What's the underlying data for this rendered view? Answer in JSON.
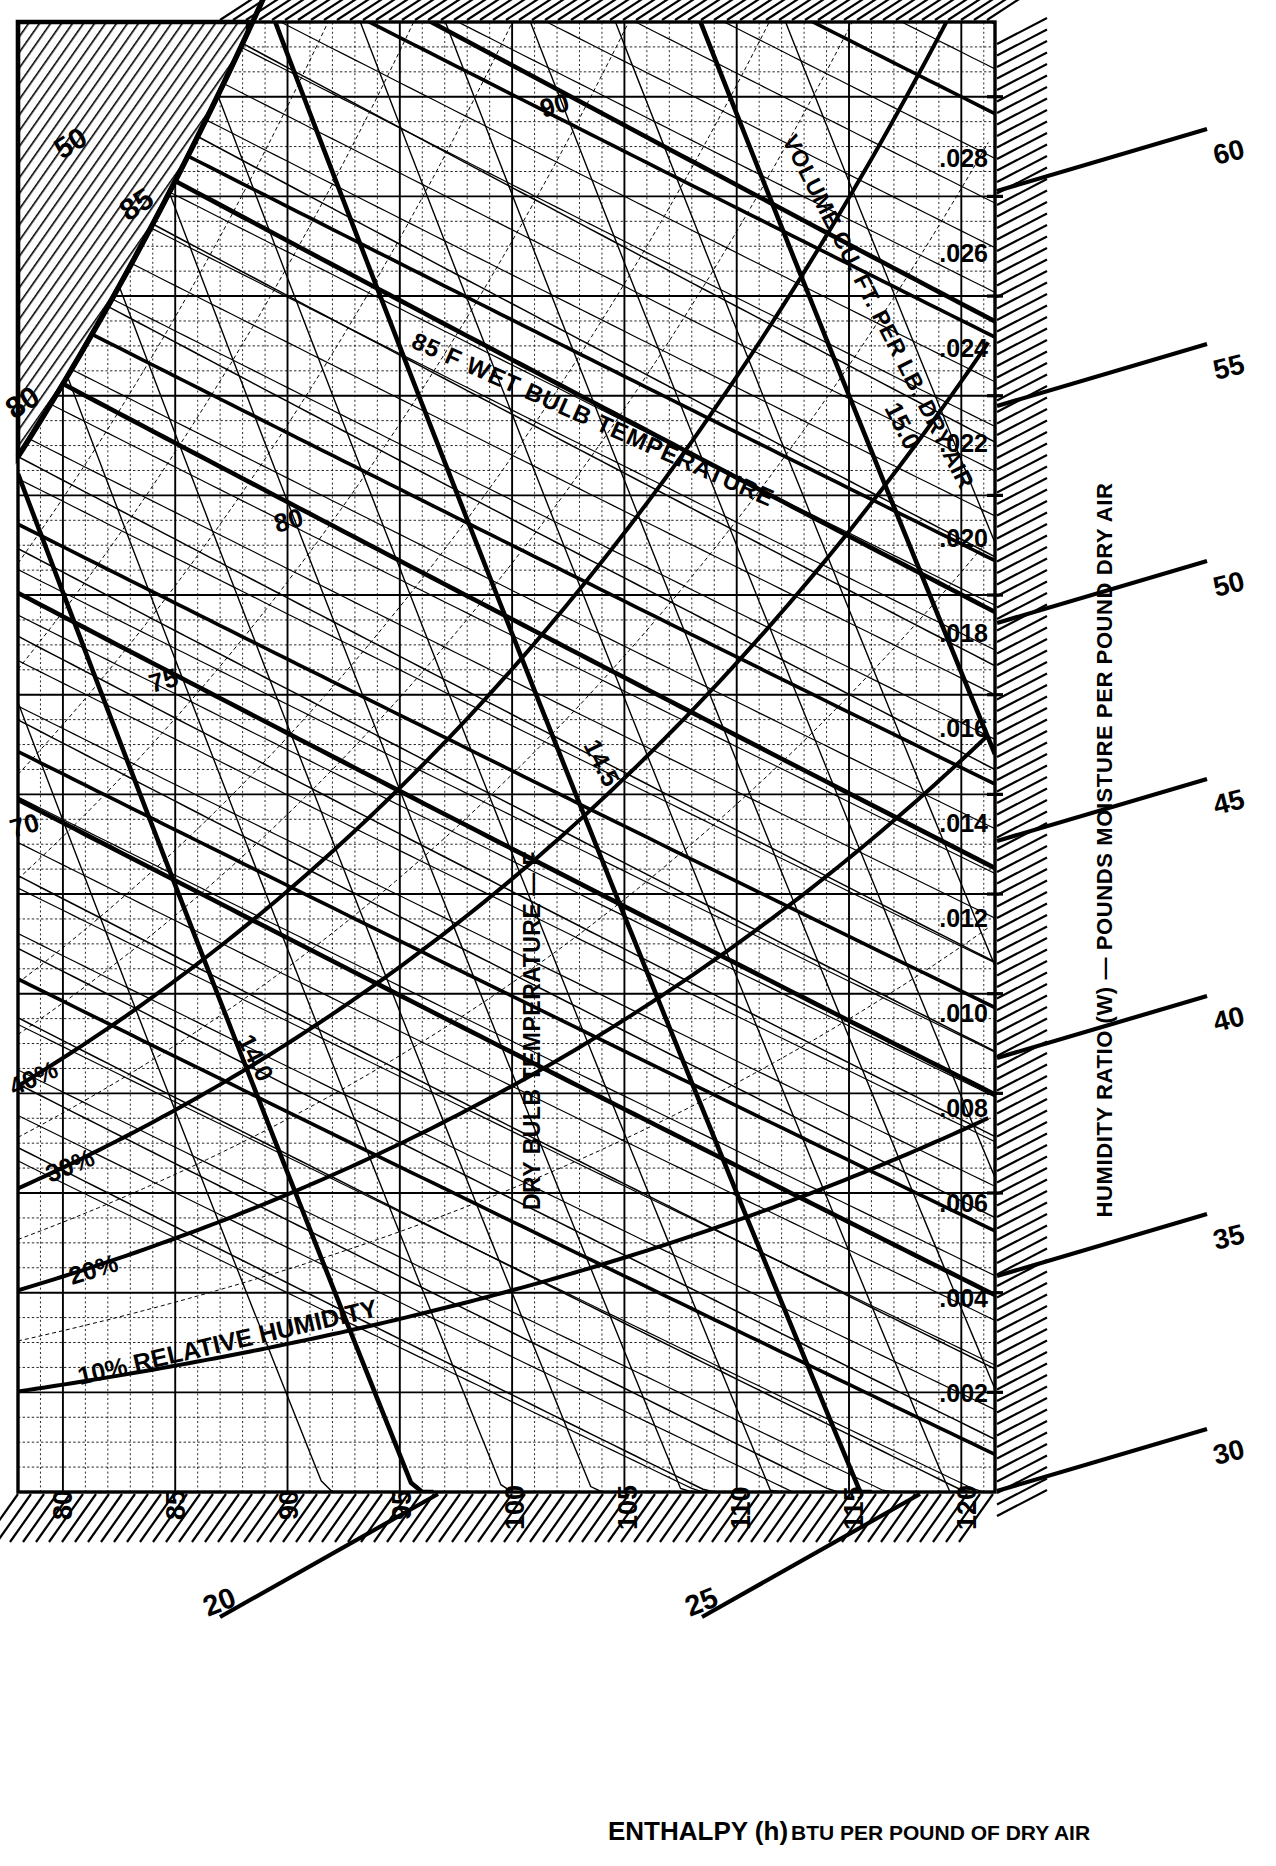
{
  "chart_data": {
    "type": "line",
    "xlabel": "DRY BULB TEMPERATURE — F",
    "ylabel": "HUMIDITY RATIO (W) — POUNDS MOISTURE PER POUND DRY AIR",
    "bottom_label": "ENTHALPY (h)",
    "bottom_label_small": "BTU PER POUND OF DRY AIR",
    "xlim": [
      78,
      121.5
    ],
    "ylim": [
      0,
      0.0295
    ],
    "grid": true,
    "legend": "none",
    "dry_bulb_ticks": [
      80,
      85,
      90,
      95,
      100,
      105,
      110,
      115,
      120
    ],
    "dry_bulb_minor_step": 1,
    "humidity_ratio_ticks": [
      0.002,
      0.004,
      0.006,
      0.008,
      0.01,
      0.012,
      0.014,
      0.016,
      0.018,
      0.02,
      0.022,
      0.024,
      0.026,
      0.028
    ],
    "humidity_ratio_tick_labels": [
      ".002",
      ".004",
      ".006",
      ".008",
      ".010",
      ".012",
      ".014",
      ".016",
      ".018",
      ".020",
      ".022",
      ".024",
      ".026",
      ".028"
    ],
    "enthalpy_right_ticks": [
      30,
      35,
      40,
      45,
      50,
      55,
      60
    ],
    "enthalpy_bottom_ticks": [
      20,
      25
    ],
    "enthalpy_units": "BTU per pound of dry air",
    "relative_humidity_curves": [
      {
        "label": "10% RELATIVE HUMIDITY",
        "value": 10
      },
      {
        "label": "20%",
        "value": 20
      },
      {
        "label": "30%",
        "value": 30
      },
      {
        "label": "40%",
        "value": 40
      }
    ],
    "wet_bulb_lines": [
      {
        "label": "70",
        "value": 70
      },
      {
        "label": "75",
        "value": 75
      },
      {
        "label": "80",
        "value": 80
      },
      {
        "label": "85 F  WET BULB TEMPERATURE",
        "value": 85
      },
      {
        "label": "90",
        "value": 90
      }
    ],
    "wet_bulb_saturation_labels": [
      "80",
      "85"
    ],
    "volume_lines": [
      {
        "label": "14.0",
        "value": 14.0
      },
      {
        "label": "14.5",
        "value": 14.5
      },
      {
        "label": "15.0",
        "value": 15.0
      }
    ],
    "volume_axis_label": "VOLUME CU. FT. PER LB. DRY AIR"
  },
  "axes": {
    "x_title": "DRY BULB TEMPERATURE — F",
    "y_title": "HUMIDITY RATIO (W) — POUNDS MOISTURE PER POUND DRY AIR",
    "enthalpy_title_main": "ENTHALPY (h)",
    "enthalpy_title_sub": "BTU PER POUND OF DRY AIR",
    "volume_title": "VOLUME CU. FT. PER LB. DRY AIR"
  },
  "x_ticks": [
    "80",
    "85",
    "90",
    "95",
    "100",
    "105",
    "110",
    "115",
    "120"
  ],
  "y_ticks": [
    ".002",
    ".004",
    ".006",
    ".008",
    ".010",
    ".012",
    ".014",
    ".016",
    ".018",
    ".020",
    ".022",
    ".024",
    ".026",
    ".028"
  ],
  "enthalpy_right": [
    "30",
    "35",
    "40",
    "45",
    "50",
    "55",
    "60"
  ],
  "enthalpy_bottom": [
    "20",
    "25"
  ],
  "enthalpy_top_left": "50",
  "wet_bulb_labels": {
    "wb70": "70",
    "wb75": "75",
    "wb80": "80",
    "wb85_full": "85 F   WET BULB TEMPERATURE",
    "wb90": "90",
    "sat80": "80",
    "sat85": "85"
  },
  "rh_labels": {
    "rh10": "10% RELATIVE HUMIDITY",
    "rh20": "20%",
    "rh30": "30%",
    "rh40": "40%"
  },
  "volume_labels": {
    "v140": "14.0",
    "v145": "14.5",
    "v150": "15.0"
  }
}
